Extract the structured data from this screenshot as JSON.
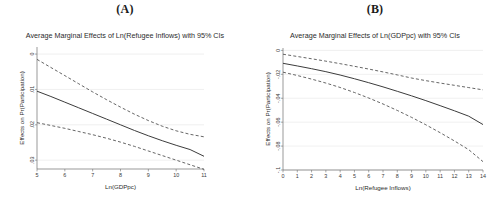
{
  "figure": {
    "background": "#ffffff",
    "line_color": "#3c3c3c",
    "grid_color": "#d8d8d8"
  },
  "panels": [
    {
      "letter": "(A)",
      "title": "Average Marginal Effects of Ln(Refugee Inflows) with 95% CIs",
      "xlabel": "Ln(GDPpc)",
      "ylabel": "Effects on Pr(Participation)",
      "xticks": [
        "5",
        "6",
        "7",
        "8",
        "9",
        "10",
        "11"
      ],
      "yticks": [
        ".03",
        ".02",
        ".01",
        "0"
      ]
    },
    {
      "letter": "(B)",
      "title": "Average Marginal Effects of Ln(GDPpc) with 95% CIs",
      "xlabel": "Ln(Refugee Inflows)",
      "ylabel": "Effects on Pr(Participation)",
      "xticks": [
        "0",
        "1",
        "2",
        "3",
        "4",
        "5",
        "6",
        "7",
        "8",
        "9",
        "10",
        "11",
        "12",
        "13",
        "14"
      ],
      "yticks": [
        "0",
        "-.02",
        "-.04",
        "-.06",
        "-.08",
        "-.1"
      ]
    }
  ],
  "chart_data": [
    {
      "type": "line",
      "panel": "(A)",
      "title": "Average Marginal Effects of Ln(Refugee Inflows) with 95% CIs",
      "xlabel": "Ln(GDPpc)",
      "ylabel": "Effects on Pr(Participation)",
      "xlim": [
        5,
        11
      ],
      "ylim": [
        -0.0025,
        0.032
      ],
      "xticks": [
        5,
        6,
        7,
        8,
        9,
        10,
        11
      ],
      "yticks": [
        0,
        0.01,
        0.02,
        0.03
      ],
      "grid": true,
      "legend": "none",
      "x": [
        5,
        5.5,
        6,
        6.5,
        7,
        7.5,
        8,
        8.5,
        9,
        9.5,
        10,
        10.5,
        11
      ],
      "series": [
        {
          "name": "Upper 95% CI",
          "style": "dashed",
          "values": [
            0.0285,
            0.0262,
            0.0239,
            0.0216,
            0.0193,
            0.0171,
            0.015,
            0.013,
            0.0112,
            0.0096,
            0.0083,
            0.0073,
            0.0066
          ]
        },
        {
          "name": "Average marginal effect",
          "style": "solid",
          "values": [
            0.0195,
            0.018,
            0.0164,
            0.0148,
            0.0132,
            0.0116,
            0.01,
            0.0084,
            0.0069,
            0.0055,
            0.0042,
            0.003,
            0.0011
          ]
        },
        {
          "name": "Lower 95% CI",
          "style": "dashed",
          "values": [
            0.0106,
            0.0098,
            0.009,
            0.0081,
            0.0072,
            0.0062,
            0.0051,
            0.0039,
            0.0026,
            0.0013,
            0.0,
            -0.0013,
            -0.0026
          ]
        }
      ]
    },
    {
      "type": "line",
      "panel": "(B)",
      "title": "Average Marginal Effects of Ln(GDPpc) with 95% CIs",
      "xlabel": "Ln(Refugee Inflows)",
      "ylabel": "Effects on Pr(Participation)",
      "xlim": [
        0,
        14
      ],
      "ylim": [
        -0.1,
        0.002
      ],
      "xticks": [
        0,
        1,
        2,
        3,
        4,
        5,
        6,
        7,
        8,
        9,
        10,
        11,
        12,
        13,
        14
      ],
      "yticks": [
        0,
        -0.02,
        -0.04,
        -0.06,
        -0.08,
        -0.1
      ],
      "grid": true,
      "legend": "none",
      "x": [
        0,
        1,
        2,
        3,
        4,
        5,
        6,
        7,
        8,
        9,
        10,
        11,
        12,
        13,
        14
      ],
      "series": [
        {
          "name": "Upper 95% CI",
          "style": "dashed",
          "values": [
            -0.0032,
            -0.0051,
            -0.007,
            -0.009,
            -0.0111,
            -0.0133,
            -0.0156,
            -0.018,
            -0.0205,
            -0.0231,
            -0.0253,
            -0.0273,
            -0.0292,
            -0.0311,
            -0.033
          ]
        },
        {
          "name": "Average marginal effect",
          "style": "solid",
          "values": [
            -0.0108,
            -0.013,
            -0.0153,
            -0.0178,
            -0.0206,
            -0.0237,
            -0.027,
            -0.0305,
            -0.0342,
            -0.038,
            -0.042,
            -0.0462,
            -0.0505,
            -0.055,
            -0.062
          ]
        },
        {
          "name": "Lower 95% CI",
          "style": "dashed",
          "values": [
            -0.0182,
            -0.021,
            -0.024,
            -0.0273,
            -0.031,
            -0.0352,
            -0.0398,
            -0.0448,
            -0.0502,
            -0.056,
            -0.0622,
            -0.0688,
            -0.0757,
            -0.083,
            -0.093
          ]
        }
      ]
    }
  ]
}
